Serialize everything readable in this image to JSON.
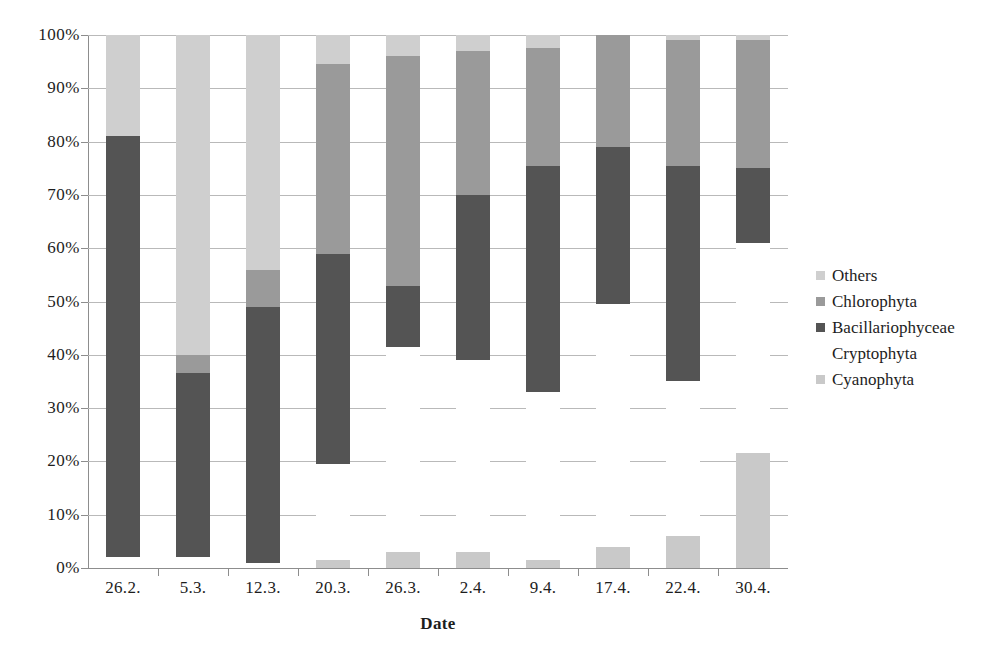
{
  "chart_data": {
    "type": "bar",
    "subtype": "stacked-100-percent",
    "title": "",
    "xlabel": "Date",
    "ylabel": "",
    "ylim": [
      0,
      100
    ],
    "ytick_labels": [
      "0%",
      "10%",
      "20%",
      "30%",
      "40%",
      "50%",
      "60%",
      "70%",
      "80%",
      "90%",
      "100%"
    ],
    "ytick_values": [
      0,
      10,
      20,
      30,
      40,
      50,
      60,
      70,
      80,
      90,
      100
    ],
    "grid": true,
    "legend_position": "right",
    "categories": [
      "26.2.",
      "5.3.",
      "12.3.",
      "20.3.",
      "26.3.",
      "2.4.",
      "9.4.",
      "17.4.",
      "22.4.",
      "30.4."
    ],
    "stack_order_bottom_to_top": [
      "Cyanophyta",
      "Cryptophyta",
      "Bacillariophyceae",
      "Chlorophyta",
      "Others"
    ],
    "series": [
      {
        "name": "Cyanophyta",
        "color": "#c9c9c9",
        "values": [
          0,
          0,
          0,
          1.5,
          3,
          3,
          1.5,
          4,
          6,
          21.5
        ]
      },
      {
        "name": "Cryptophyta",
        "color": "#ffffff",
        "values": [
          2,
          2,
          1,
          18,
          38.5,
          36,
          31.5,
          45.5,
          29,
          39.5
        ]
      },
      {
        "name": "Bacillariophyceae",
        "color": "#545454",
        "values": [
          79,
          34.5,
          48,
          39.5,
          11.5,
          31,
          42.5,
          29.5,
          40.5,
          14
        ]
      },
      {
        "name": "Chlorophyta",
        "color": "#9a9a9a",
        "values": [
          0,
          3.5,
          7,
          35.5,
          43,
          27,
          22,
          21,
          23.5,
          24
        ]
      },
      {
        "name": "Others",
        "color": "#cfcfcf",
        "values": [
          19,
          60,
          44,
          5.5,
          4,
          3,
          2.5,
          0,
          1,
          1
        ]
      }
    ]
  },
  "legend": {
    "items": [
      {
        "label": "Others",
        "color": "#cfcfcf",
        "swatch": true
      },
      {
        "label": "Chlorophyta",
        "color": "#9a9a9a",
        "swatch": true
      },
      {
        "label": "Bacillariophyceae",
        "color": "#545454",
        "swatch": true
      },
      {
        "label": "Cryptophyta",
        "color": "#ffffff",
        "swatch": false
      },
      {
        "label": "Cyanophyta",
        "color": "#c9c9c9",
        "swatch": true
      }
    ]
  },
  "axis": {
    "x_title": "Date"
  }
}
